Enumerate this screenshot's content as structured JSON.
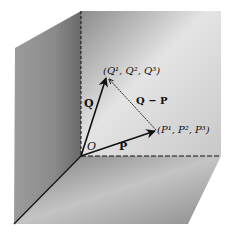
{
  "diagram": {
    "type": "3d-vector-subtraction",
    "origin_label": "O",
    "vectors": {
      "Q": {
        "label": "Q"
      },
      "P": {
        "label": "P"
      },
      "QminusP": {
        "label": "Q − P"
      }
    },
    "points": {
      "Q_point": {
        "label": "(Q¹, Q², Q³)"
      },
      "P_point": {
        "label": "(P¹, P², P³)"
      }
    },
    "colors": {
      "ink": "#111111",
      "back_wall": "#9a9a9a",
      "left_wall": "#8a8a8a",
      "floor": "#a8a8a8"
    }
  }
}
